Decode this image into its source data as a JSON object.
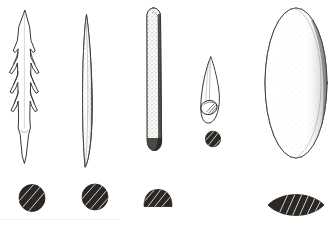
{
  "plate": {
    "title": "Bone and antler artefact plate",
    "background_color": "#ffffff",
    "ink_color": "#24211f",
    "cross_section_fill": "#2a2725",
    "width": 331,
    "height": 225,
    "style": "archaeological line drawing with stipple shading",
    "artifact_count": 5,
    "cross_section_count": 5
  },
  "artifacts": [
    {
      "id": "artifact-1",
      "name": "barbed-point",
      "label": "Barbed bone point",
      "description": "Slender bilaterally barbed point with three pairs of barbs and a tapering tang",
      "shading": "unshaded outline",
      "barb_pairs": 3,
      "cross_section": {
        "name": "circular-section",
        "label": "Circular section",
        "shape": "circle",
        "fill": "#2a2725",
        "hatching": "diagonal"
      }
    },
    {
      "id": "artifact-2",
      "name": "lanceolate-point",
      "label": "Lanceolate bone point",
      "description": "Long narrow double-pointed blade, stipple shaded along the right edge",
      "shading": "stipple right edge",
      "cross_section": {
        "name": "circular-section",
        "label": "Circular section",
        "shape": "circle",
        "fill": "#2a2725",
        "hatching": "diagonal"
      }
    },
    {
      "id": "artifact-3",
      "name": "bone-rod",
      "label": "Rounded bone rod",
      "description": "Parallel-sided rod with rounded terminals and a dense stippled right margin",
      "shading": "stipple right edge and base",
      "cross_section": {
        "name": "plano-convex-section",
        "label": "Plano-convex (D-shaped) section",
        "shape": "d-shape",
        "fill": "#2a2725",
        "hatching": "diagonal"
      }
    },
    {
      "id": "artifact-4",
      "name": "eyed-needle",
      "label": "Eyed bone needle",
      "description": "Short leaf-shaped point with an oval perforation (eye) near the base",
      "shading": "light hatching",
      "perforation": "oval eye",
      "cross_section": {
        "name": "circular-section",
        "label": "Circular section",
        "shape": "circle",
        "fill": "#2a2725",
        "hatching": "diagonal"
      }
    },
    {
      "id": "artifact-5",
      "name": "oval-plaque",
      "label": "Oval bone plaque",
      "description": "Large elongated oval plaque with stippled shading on the right side",
      "shading": "stipple right side",
      "cross_section": {
        "name": "lenticular-section",
        "label": "Lenticular (lens) section",
        "shape": "lens",
        "fill": "#2a2725",
        "hatching": "diagonal"
      }
    }
  ]
}
